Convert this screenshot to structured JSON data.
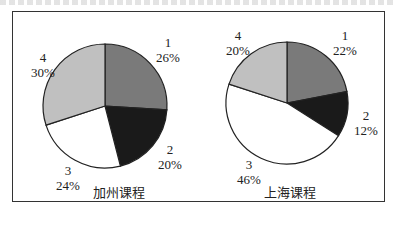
{
  "chart_data": [
    {
      "type": "pie",
      "title": "加州课程",
      "categories": [
        "1",
        "2",
        "3",
        "4"
      ],
      "values": [
        26,
        20,
        24,
        30
      ],
      "labels": [
        "26%",
        "20%",
        "24%",
        "30%"
      ],
      "colors": [
        "#7a7a7a",
        "#1a1a1a",
        "#ffffff",
        "#c0c0c0"
      ],
      "start_angle": "12 o'clock, clockwise"
    },
    {
      "type": "pie",
      "title": "上海课程",
      "categories": [
        "1",
        "2",
        "3",
        "4"
      ],
      "values": [
        22,
        12,
        46,
        20
      ],
      "labels": [
        "22%",
        "12%",
        "46%",
        "20%"
      ],
      "colors": [
        "#7a7a7a",
        "#1a1a1a",
        "#ffffff",
        "#c0c0c0"
      ],
      "start_angle": "12 o'clock, clockwise"
    }
  ],
  "left": {
    "title": "加州课程",
    "s1": {
      "name": "1",
      "pct": "26%"
    },
    "s2": {
      "name": "2",
      "pct": "20%"
    },
    "s3": {
      "name": "3",
      "pct": "24%"
    },
    "s4": {
      "name": "4",
      "pct": "30%"
    }
  },
  "right": {
    "title": "上海课程",
    "s1": {
      "name": "1",
      "pct": "22%"
    },
    "s2": {
      "name": "2",
      "pct": "12%"
    },
    "s3": {
      "name": "3",
      "pct": "46%"
    },
    "s4": {
      "name": "4",
      "pct": "20%"
    }
  }
}
